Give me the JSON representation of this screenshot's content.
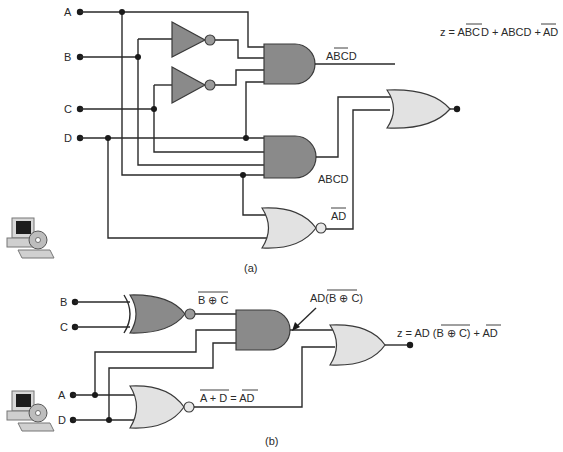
{
  "figure_a": {
    "caption": "(a)",
    "inputs": {
      "a": "A",
      "b": "B",
      "c": "C",
      "d": "D"
    },
    "gates": {
      "and1_output_label": {
        "plain": "A",
        "overbar": "BC",
        "tail": "D",
        "full": "ABCD with B and C complemented"
      },
      "and2_output_label": "ABCD",
      "nor_output_label": {
        "overbar": "AD"
      },
      "output_expression": {
        "prefix": "z = A",
        "overbar1": "BC",
        "mid1": "D + ABCD +",
        "overbar2": "AD"
      }
    },
    "gate_types": [
      "NOT",
      "NOT",
      "AND",
      "AND",
      "NOR",
      "OR"
    ]
  },
  "figure_b": {
    "caption": "(b)",
    "inputs": {
      "b": "B",
      "c": "C",
      "a": "A",
      "d": "D"
    },
    "gates": {
      "xnor_output_label": {
        "overbar": "B ⊕ C"
      },
      "and_output_label": {
        "prefix": "AD(",
        "overbar": "B ⊕ C",
        "suffix": ")"
      },
      "nor_output_label": {
        "overbar_left": "A + D",
        "eq": " = ",
        "overbar_right": "AD"
      },
      "output_expression": {
        "prefix": "z = AD (",
        "overbar1": "B ⊕ C",
        "mid": ") + ",
        "overbar2": "AD"
      }
    },
    "gate_types": [
      "XNOR",
      "AND",
      "NOR",
      "OR"
    ]
  },
  "icons": [
    "computer-cd-icon",
    "computer-cd-icon"
  ],
  "colors": {
    "dark_gate": "#8a8a8a",
    "light_gate": "#e2e2e2",
    "wire": "#2a2a2a",
    "background": "#ffffff"
  }
}
